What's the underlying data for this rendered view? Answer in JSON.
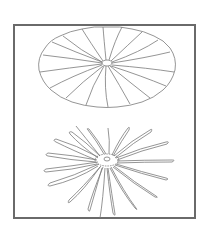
{
  "figure": {
    "frame_color": "#6a6a6a",
    "line_color": "#7a7a7a",
    "panels": [
      {
        "name": "open-canopy",
        "center": [
          107,
          63
        ],
        "rx": 68,
        "ry": 42,
        "gores": 20
      },
      {
        "name": "collapsed-canopy",
        "center": [
          107,
          161
        ],
        "petals": 22
      }
    ]
  }
}
